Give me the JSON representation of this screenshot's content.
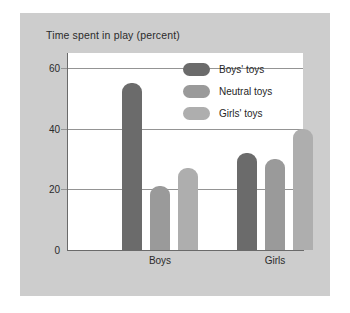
{
  "chart_data": {
    "type": "bar",
    "title": "Time spent in play (percent)",
    "xlabel": "",
    "ylabel": "",
    "categories": [
      "Boys",
      "Girls"
    ],
    "series": [
      {
        "name": "Boys' toys",
        "values": [
          55,
          32
        ],
        "color": "#6b6b6b"
      },
      {
        "name": "Neutral toys",
        "values": [
          21,
          30
        ],
        "color": "#9a9a9a"
      },
      {
        "name": "Girls' toys",
        "values": [
          27,
          40
        ],
        "color": "#aeaeae"
      }
    ],
    "ylim": [
      0,
      65
    ],
    "yticks": [
      0,
      20,
      40,
      60
    ],
    "ytick_labels": [
      "0",
      "20",
      "40",
      "60"
    ],
    "grid": true,
    "legend_position": "top-right"
  },
  "style": {
    "panel_background": "#cdcdcd",
    "plot_background": "#ffffff",
    "gridline_color": "#949494",
    "axis_color": "#6a6a6a",
    "text_color": "#2b2b2b",
    "page_background": "#ffffff"
  }
}
